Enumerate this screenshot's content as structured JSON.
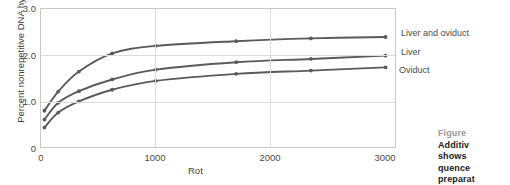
{
  "chart_data": {
    "type": "line",
    "title": "",
    "xlabel": "Rot",
    "ylabel": "Percent nonrepetitive DNA hybridized",
    "xlim": [
      0,
      3100
    ],
    "ylim": [
      0,
      3.0
    ],
    "xticks": [
      "0",
      "1000",
      "2000",
      "3000"
    ],
    "xtick_values": [
      0,
      1000,
      2000,
      3000
    ],
    "yticks": [
      "0",
      "1.0",
      "2.0",
      "3.0"
    ],
    "ytick_values": [
      0,
      1.0,
      2.0,
      3.0
    ],
    "grid": "both",
    "legend_position": "right-inline",
    "series": [
      {
        "name": "Liver and oviduct",
        "color": "#5a5a5a",
        "x": [
          30,
          150,
          330,
          620,
          1000,
          1700,
          2350,
          3000
        ],
        "y": [
          0.82,
          1.23,
          1.66,
          2.05,
          2.21,
          2.31,
          2.37,
          2.4
        ]
      },
      {
        "name": "Liver",
        "color": "#5a5a5a",
        "x": [
          30,
          150,
          330,
          620,
          1000,
          1700,
          2350,
          3000
        ],
        "y": [
          0.63,
          0.99,
          1.24,
          1.49,
          1.7,
          1.86,
          1.93,
          2.0
        ]
      },
      {
        "name": "Oviduct",
        "color": "#5a5a5a",
        "x": [
          30,
          150,
          330,
          620,
          1000,
          1700,
          2350,
          3000
        ],
        "y": [
          0.46,
          0.78,
          1.02,
          1.27,
          1.46,
          1.61,
          1.68,
          1.75
        ]
      }
    ]
  },
  "caption": {
    "heading": "Figure",
    "lines": [
      "Additiv",
      "shows",
      "quence",
      "preparat"
    ]
  },
  "colors": {
    "curve": "#5a5a5a",
    "frame": "#c8c8c8",
    "grid": "#dcdcdc",
    "axis_text": "#4a4a4a",
    "caption_head": "#9a9a9a",
    "caption_body": "#1a1a1a"
  }
}
